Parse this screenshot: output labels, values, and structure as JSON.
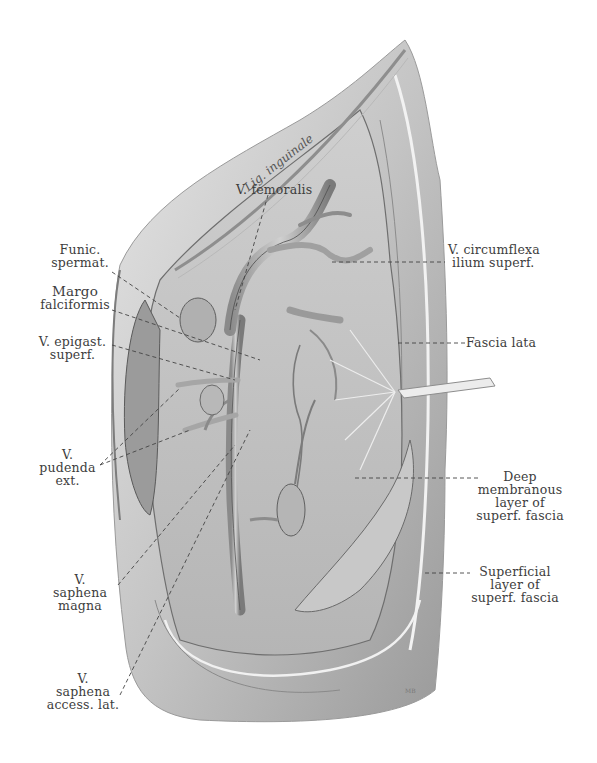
{
  "figure": {
    "type": "anatomical illustration",
    "colors": {
      "background": "#ffffff",
      "tissue_light": "#d9d9d9",
      "tissue_mid": "#a8a8a8",
      "tissue_dark": "#6e6e6e",
      "label_text": "#3d3d3d",
      "leader_line": "#444444"
    },
    "signature": "MB"
  },
  "labels": {
    "lig_inguinale": "Lig. inguinale",
    "v_femoralis": "V. femoralis",
    "funic_spermat": [
      "Funic.",
      "spermat."
    ],
    "margo_falciformis": [
      "Margo",
      "falciformis"
    ],
    "v_epigast_superf": [
      "V. epigast.",
      "superf."
    ],
    "v_pudenda_ext": [
      "V.",
      "pudenda",
      "ext."
    ],
    "v_saphena_magna": [
      "V.",
      "saphena",
      "magna"
    ],
    "v_saphena_access_lat": [
      "V.",
      "saphena",
      "access. lat."
    ],
    "v_circumflexa_ilium_superf": [
      "V. circumflexa",
      "ilium superf."
    ],
    "fascia_lata": "Fascia lata",
    "deep_membranous_layer": [
      "Deep",
      "membranous",
      "layer of",
      "superf. fascia"
    ],
    "superficial_layer": [
      "Superficial",
      "layer of",
      "superf. fascia"
    ]
  }
}
